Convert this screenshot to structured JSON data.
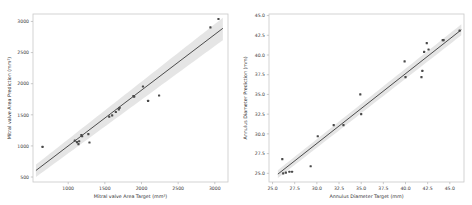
{
  "figure": {
    "background_color": "#ffffff",
    "panel_count": 2
  },
  "chart_data": [
    {
      "type": "scatter",
      "title": "",
      "panel_position": "left",
      "xlabel": "Mitral valve Area Target (mm²)",
      "ylabel": "Mitral valve Area Prediction (mm²)",
      "xlim": [
        520,
        3180
      ],
      "ylim": [
        420,
        3120
      ],
      "xticks": [
        1000,
        1500,
        2000,
        2500,
        3000
      ],
      "xticklabels": [
        "1000",
        "1500",
        "2000",
        "2500",
        "3000"
      ],
      "yticks": [
        500,
        1000,
        1500,
        2000,
        2500,
        3000
      ],
      "yticklabels": [
        "500",
        "1000",
        "1500",
        "2000",
        "2500",
        "3000"
      ],
      "grid": false,
      "legend": "none",
      "marker_color": "#4a4a4a",
      "line_color": "#3a3a3a",
      "band_color": "#cfcfcf",
      "points": [
        [
          650,
          985
        ],
        [
          1090,
          1085
        ],
        [
          1120,
          1060
        ],
        [
          1140,
          1030
        ],
        [
          1150,
          1075
        ],
        [
          1180,
          1175
        ],
        [
          1190,
          1155
        ],
        [
          1275,
          1190
        ],
        [
          1290,
          1055
        ],
        [
          1560,
          1470
        ],
        [
          1600,
          1490
        ],
        [
          1650,
          1545
        ],
        [
          1690,
          1585
        ],
        [
          1700,
          1610
        ],
        [
          1890,
          1800
        ],
        [
          1900,
          1790
        ],
        [
          2020,
          1955
        ],
        [
          2090,
          1725
        ],
        [
          2240,
          1810
        ],
        [
          2940,
          2905
        ],
        [
          3050,
          3040
        ]
      ],
      "regression": {
        "x_start": 560,
        "y_start": 605,
        "x_end": 3110,
        "y_end": 2890
      },
      "confidence_band": {
        "x_start": 560,
        "y_start_lower": 500,
        "y_start_upper": 700,
        "x_end": 3110,
        "y_end_lower": 2700,
        "y_end_upper": 3060
      }
    },
    {
      "type": "scatter",
      "title": "",
      "panel_position": "right",
      "xlabel": "Annulus Diameter Target (mm)",
      "ylabel": "Annulus Diameter Prediction (mm)",
      "xlim": [
        24.6,
        46.6
      ],
      "ylim": [
        23.9,
        45.2
      ],
      "xticks": [
        25.0,
        27.5,
        30.0,
        32.5,
        35.0,
        37.5,
        40.0,
        42.5,
        45.0
      ],
      "xticklabels": [
        "25.0",
        "27.5",
        "30.0",
        "32.5",
        "35.0",
        "37.5",
        "40.0",
        "42.5",
        "45.0"
      ],
      "yticks": [
        25.0,
        27.5,
        30.0,
        32.5,
        35.0,
        37.5,
        40.0,
        42.5,
        45.0
      ],
      "yticklabels": [
        "25.0",
        "27.5",
        "30.0",
        "32.5",
        "35.0",
        "37.5",
        "40.0",
        "42.5",
        "45.0"
      ],
      "grid": false,
      "legend": "none",
      "marker_color": "#4a4a4a",
      "line_color": "#3a3a3a",
      "band_color": "#cfcfcf",
      "points": [
        [
          26.1,
          26.8
        ],
        [
          26.2,
          25.0
        ],
        [
          26.5,
          25.1
        ],
        [
          26.9,
          25.2
        ],
        [
          27.2,
          25.2
        ],
        [
          29.3,
          25.9
        ],
        [
          30.1,
          29.7
        ],
        [
          31.9,
          31.1
        ],
        [
          33.0,
          31.1
        ],
        [
          34.9,
          35.0
        ],
        [
          35.0,
          32.5
        ],
        [
          39.9,
          39.2
        ],
        [
          40.0,
          37.2
        ],
        [
          41.8,
          37.2
        ],
        [
          41.9,
          38.0
        ],
        [
          42.1,
          40.4
        ],
        [
          42.4,
          41.5
        ],
        [
          42.6,
          40.7
        ],
        [
          44.2,
          41.9
        ],
        [
          44.3,
          41.9
        ],
        [
          46.1,
          43.1
        ]
      ],
      "regression": {
        "x_start": 25.6,
        "y_start": 24.9,
        "x_end": 46.3,
        "y_end": 43.2
      },
      "confidence_band": {
        "x_start": 25.6,
        "y_start_lower": 24.4,
        "y_start_upper": 25.4,
        "x_end": 46.3,
        "y_end_lower": 42.5,
        "y_end_upper": 43.9
      }
    }
  ]
}
